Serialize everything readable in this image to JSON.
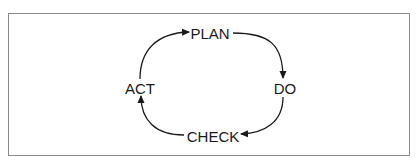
{
  "diagram": {
    "type": "cycle",
    "nodes": [
      {
        "id": "plan",
        "label": "PLAN"
      },
      {
        "id": "do",
        "label": "DO"
      },
      {
        "id": "check",
        "label": "CHECK"
      },
      {
        "id": "act",
        "label": "ACT"
      }
    ],
    "edges": [
      {
        "from": "PLAN",
        "to": "DO"
      },
      {
        "from": "DO",
        "to": "CHECK"
      },
      {
        "from": "CHECK",
        "to": "ACT"
      },
      {
        "from": "ACT",
        "to": "PLAN"
      }
    ],
    "colors": {
      "stroke": "#1a1a1a",
      "frame": "#8a8a8a",
      "background": "#ffffff"
    }
  }
}
